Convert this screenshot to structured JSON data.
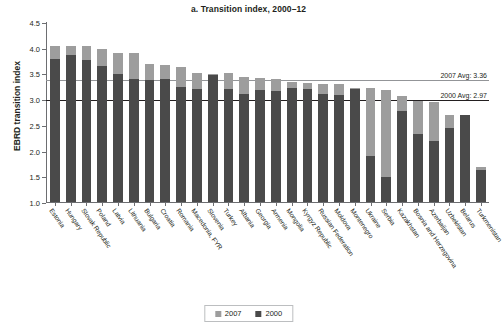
{
  "chart_data": {
    "type": "bar",
    "title": "a. Transition index, 2000–12",
    "xlabel": "",
    "ylabel": "EBRD transition index",
    "ylim": [
      1.0,
      4.5
    ],
    "ytick_labels": [
      "4.5",
      "4.0",
      "3.5",
      "3.0",
      "2.5",
      "2.0",
      "1.5",
      "1.0"
    ],
    "ytick_values": [
      4.5,
      4.0,
      3.5,
      3.0,
      2.5,
      2.0,
      1.5,
      1.0
    ],
    "grid": false,
    "stacked": true,
    "legend_position": "bottom",
    "categories": [
      "Estonia",
      "Hungary",
      "Slovak Republic",
      "Poland",
      "Latvia",
      "Lithuania",
      "Bulgaria",
      "Croatia",
      "Romania",
      "Macedonia, FYR",
      "Slovenia",
      "Turkey",
      "Albania",
      "Georgia",
      "Armenia",
      "Mongolia",
      "Kyrgyz Republic",
      "Russian Federation",
      "Moldova",
      "Montenegro",
      "Ukraine",
      "Serbia",
      "Kazakhstan",
      "Bosnia and Herzegovina",
      "Azerbaijan",
      "Uzbekistan",
      "Belarus",
      "Turkmenistan"
    ],
    "series": [
      {
        "name": "2000",
        "color": "#4a4a4a",
        "values": [
          3.78,
          3.86,
          3.76,
          3.65,
          3.48,
          3.4,
          3.37,
          3.4,
          3.24,
          3.19,
          3.47,
          3.19,
          3.11,
          3.18,
          3.15,
          3.22,
          3.19,
          3.11,
          3.09,
          3.19,
          1.9,
          1.48,
          2.77,
          2.33,
          2.18,
          2.44,
          2.7,
          1.62
        ]
      },
      {
        "name": "2007",
        "color": "#9d9d9d",
        "values": [
          4.04,
          4.04,
          4.03,
          3.97,
          3.9,
          3.9,
          3.68,
          3.67,
          3.63,
          3.5,
          3.48,
          3.5,
          3.43,
          3.41,
          3.4,
          3.34,
          3.32,
          3.3,
          3.3,
          3.22,
          3.22,
          3.17,
          3.07,
          2.96,
          2.95,
          2.7,
          2.07,
          1.68
        ]
      }
    ],
    "reference_lines": [
      {
        "name": "2007 Avg",
        "label": "2007 Avg: 3.36",
        "value": 3.36,
        "color": "#939598"
      },
      {
        "name": "2000 Avg",
        "label": "2000 Avg: 2.97",
        "value": 2.97,
        "color": "#231f20"
      }
    ],
    "legend": [
      {
        "label": "2007",
        "color": "#9d9d9d"
      },
      {
        "label": "2000",
        "color": "#4a4a4a"
      }
    ]
  }
}
